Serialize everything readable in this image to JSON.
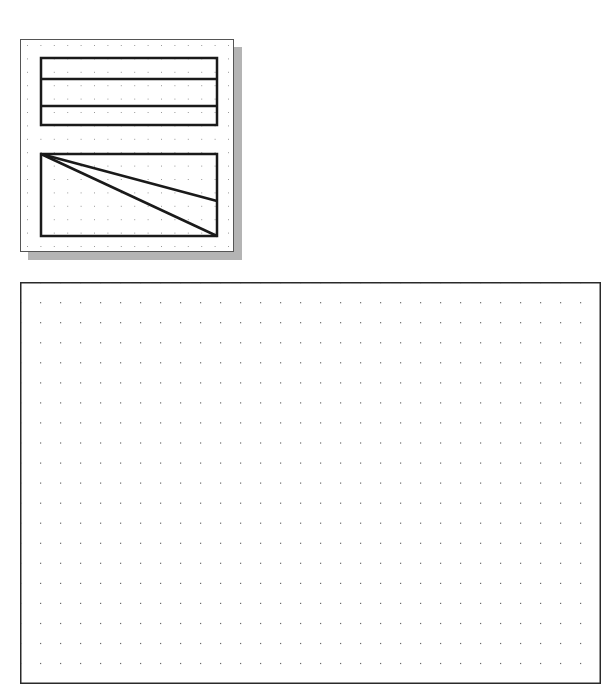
{
  "thumbnail": {
    "name": "sketch-preview",
    "panel": {
      "x": 20,
      "y": 39,
      "width": 214,
      "height": 213
    },
    "shadow": {
      "offset_x": 8,
      "offset_y": 8,
      "color": "#b4b4b4"
    },
    "grid": {
      "spacing": 13.4,
      "dot_color": "#9a9a9a"
    },
    "stroke_color": "#1a1a1a",
    "stroke_width": 2.5,
    "shapes": {
      "banded_rectangle": {
        "x1": 40,
        "y1": 57,
        "x2": 216,
        "y2": 124,
        "divider_lines_y": [
          78,
          105
        ]
      },
      "triangle_rectangle": {
        "x1": 40,
        "y1": 153,
        "x2": 216,
        "y2": 235,
        "diagonals": [
          {
            "from": [
              40,
              153
            ],
            "to": [
              216,
              200
            ]
          },
          {
            "from": [
              40,
              153
            ],
            "to": [
              216,
              235
            ]
          }
        ]
      }
    }
  },
  "canvas": {
    "name": "drawing-area",
    "x": 20,
    "y": 282,
    "width": 580,
    "height": 401,
    "border_color": "#2a2a2a",
    "grid": {
      "spacing": 20,
      "columns": 29,
      "rows": 20,
      "dot_color": "#6a6a6a"
    }
  }
}
